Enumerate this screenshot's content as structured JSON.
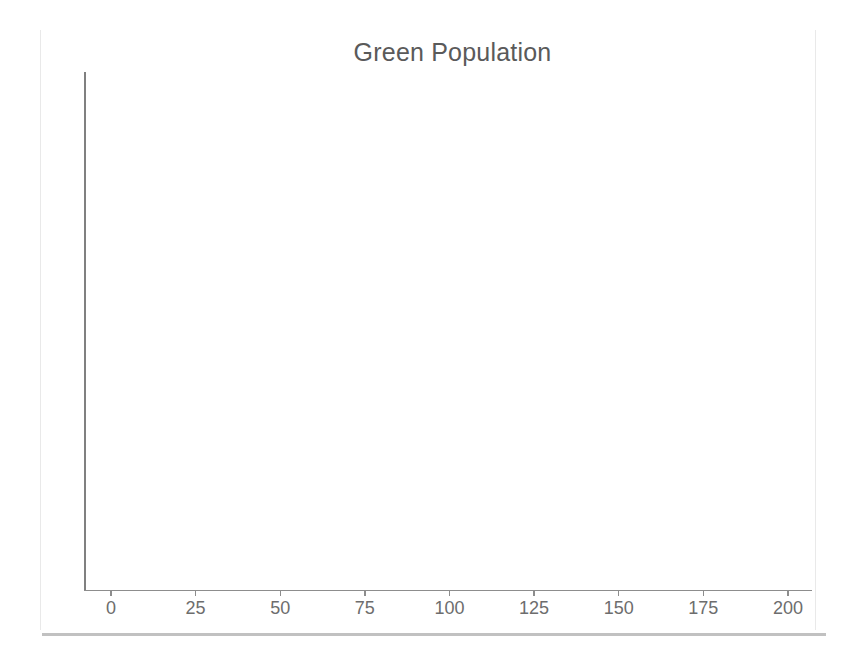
{
  "chart_data": {
    "type": "line",
    "title": "Green Population",
    "xlabel": "",
    "ylabel": "",
    "x_ticks": [
      0,
      25,
      50,
      75,
      100,
      125,
      150,
      175,
      200
    ],
    "x_tick_labels": [
      "0",
      "25",
      "50",
      "75",
      "100",
      "125",
      "150",
      "175",
      "200"
    ],
    "xlim": [
      0,
      200
    ],
    "y_ticks": [],
    "y_tick_labels": [],
    "grid": false,
    "legend": null,
    "series": [],
    "values": [],
    "annotations": [],
    "note": "Plot area is empty; no data series is rendered in the figure."
  },
  "chart": {
    "title": "Green Population",
    "axis_color": "#8d8d8d",
    "title_color": "#5a5a5a",
    "tick_label_color": "#6d6d6d",
    "background": "#ffffff"
  },
  "frame": {
    "edge_color": "#e9e9e9",
    "bottom_rule_color": "#b6b6b6"
  }
}
